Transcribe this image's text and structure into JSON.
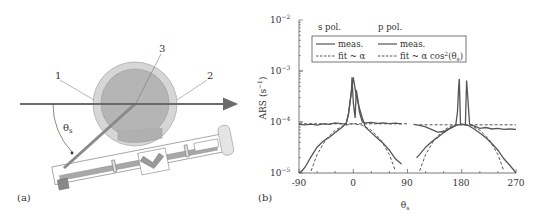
{
  "panel_a": {
    "label": "(a)",
    "callouts": [
      "1",
      "2",
      "3"
    ],
    "angle_label": "θ",
    "angle_subscript": "s",
    "colors": {
      "beam": "#6b6b6b",
      "outer_circle": "#d6d6d6",
      "inner_circle": "#b5b5b5",
      "stroke": "#777777"
    }
  },
  "panel_b": {
    "label": "(b)"
  },
  "chart_data": {
    "type": "line",
    "title": "",
    "xlabel": "θs",
    "ylabel": "ARS (s⁻¹)",
    "xlim": [
      -90,
      270
    ],
    "ylim": [
      1e-05,
      0.01
    ],
    "yscale": "log",
    "x_ticks": [
      "-90",
      "0",
      "90",
      "180",
      "270"
    ],
    "y_ticks": [
      "10⁻⁵",
      "10⁻⁴",
      "10⁻³",
      "10⁻²"
    ],
    "grid": false,
    "legend": {
      "position": "upper left, inside",
      "group_titles": [
        "s pol.",
        "p pol."
      ],
      "entries": [
        {
          "group": "s pol.",
          "label": "meas.",
          "style": "solid"
        },
        {
          "group": "s pol.",
          "label": "fit ~ α",
          "style": "dashed"
        },
        {
          "group": "p pol.",
          "label": "meas.",
          "style": "solid"
        },
        {
          "group": "p pol.",
          "label": "fit ~ α cos²(θs)",
          "style": "dashed"
        }
      ]
    },
    "series": [
      {
        "name": "s pol. meas.",
        "style": "solid",
        "x": [
          -90,
          -80,
          -70,
          -60,
          -50,
          -40,
          -30,
          -20,
          -12,
          -8,
          -5,
          -3,
          -2,
          0,
          3,
          5,
          8,
          10,
          15,
          20,
          30,
          40,
          50,
          60,
          70,
          80
        ],
        "y": [
          9e-05,
          8.8e-05,
          9.1e-05,
          8.7e-05,
          9.2e-05,
          9e-05,
          9.6e-05,
          9.3e-05,
          9e-05,
          0.00014,
          0.00026,
          0.0004,
          0.00075,
          0.00024,
          0.00012,
          0.00042,
          0.00026,
          0.00016,
          0.0001,
          9.6e-05,
          9.8e-05,
          9.4e-05,
          9.6e-05,
          9.3e-05,
          9.5e-05,
          9.2e-05
        ]
      },
      {
        "name": "s pol. fit ~ α",
        "style": "dashed",
        "x": [
          -90,
          90
        ],
        "y": [
          9.2e-05,
          9.2e-05
        ]
      },
      {
        "name": "p pol. meas. (s-side)",
        "style": "solid",
        "x": [
          -90,
          -85,
          -80,
          -70,
          -60,
          -50,
          -40,
          -30,
          -20,
          -15,
          -12,
          -8,
          -5,
          0,
          5,
          10,
          15,
          20,
          30,
          40,
          50,
          60,
          70,
          80
        ],
        "y": [
          1e-05,
          1.1e-05,
          1.3e-05,
          2.1e-05,
          3.2e-05,
          4.2e-05,
          5e-05,
          6.2e-05,
          7.6e-05,
          8.6e-05,
          9e-05,
          0.00014,
          0.00026,
          0.00075,
          0.00032,
          0.00019,
          0.00012,
          8e-05,
          6.2e-05,
          4.8e-05,
          3.8e-05,
          2.8e-05,
          1.9e-05,
          1.5e-05
        ]
      },
      {
        "name": "p pol. fit ~ α cos²(θs) (first)",
        "style": "dashed",
        "x": [
          -70,
          -60,
          -45,
          -30,
          -15,
          0,
          15,
          30,
          45,
          60,
          70
        ],
        "y": [
          1.1e-05,
          2.3e-05,
          4.6e-05,
          6.9e-05,
          8.6e-05,
          9.2e-05,
          8.6e-05,
          6.9e-05,
          4.6e-05,
          2.3e-05,
          1.1e-05
        ]
      },
      {
        "name": "s pol. meas. (second)",
        "style": "solid",
        "x": [
          100,
          110,
          120,
          140,
          150,
          160,
          170,
          173,
          175,
          176,
          178,
          182,
          186,
          188,
          190,
          193,
          200,
          210,
          220,
          230,
          240,
          250,
          260,
          270
        ],
        "y": [
          9e-05,
          8.6e-05,
          8e-05,
          6.3e-05,
          6.5e-05,
          7.4e-05,
          8.5e-05,
          0.00016,
          0.0005,
          0.0007,
          9e-05,
          9e-05,
          9e-05,
          0.00065,
          0.0003,
          9e-05,
          8.4e-05,
          7.5e-05,
          7.8e-05,
          7.3e-05,
          7.5e-05,
          7.2e-05,
          7.3e-05,
          7.2e-05
        ]
      },
      {
        "name": "p pol. meas. (second)",
        "style": "solid",
        "x": [
          105,
          110,
          120,
          130,
          140,
          150,
          160,
          170,
          180,
          190,
          200,
          210,
          220,
          230,
          240,
          250,
          260,
          270
        ],
        "y": [
          2e-05,
          2.3e-05,
          3.2e-05,
          4.1e-05,
          5e-05,
          6.2e-05,
          7.5e-05,
          8.6e-05,
          9e-05,
          8.6e-05,
          7.4e-05,
          6.1e-05,
          4.9e-05,
          3.8e-05,
          2.8e-05,
          1.9e-05,
          1.4e-05,
          1e-05
        ]
      },
      {
        "name": "s pol. fit ~ α (second)",
        "style": "dashed",
        "x": [
          110,
          270
        ],
        "y": [
          8.8e-05,
          8.8e-05
        ]
      },
      {
        "name": "p pol. fit ~ α cos²(θs) (second)",
        "style": "dashed",
        "x": [
          110,
          120,
          135,
          150,
          165,
          180,
          195,
          210,
          225,
          240,
          250
        ],
        "y": [
          1.1e-05,
          2.3e-05,
          4.6e-05,
          6.9e-05,
          8.6e-05,
          9e-05,
          8.6e-05,
          6.9e-05,
          4.6e-05,
          2.3e-05,
          1.1e-05
        ]
      }
    ]
  }
}
